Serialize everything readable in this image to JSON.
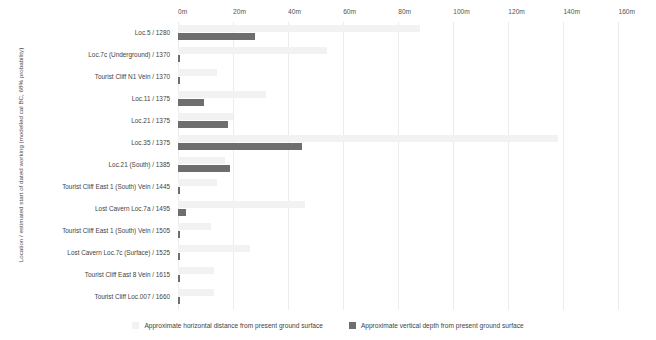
{
  "chart_data": {
    "type": "bar",
    "title": "",
    "subtitle": "",
    "orientation": "horizontal",
    "grouped": true,
    "xlabel": "",
    "ylabel": "Location / estimated start of dated working (modelled cal BC, 68% probability)",
    "xlim": [
      0,
      170
    ],
    "x_unit": "m",
    "grid": true,
    "grid_axis": "x",
    "legend_position": "bottom",
    "xticks": [
      0,
      20,
      40,
      60,
      80,
      100,
      120,
      140,
      160
    ],
    "xtick_labels": [
      "0m",
      "20m",
      "40m",
      "60m",
      "80m",
      "100m",
      "120m",
      "140m",
      "160m"
    ],
    "categories": [
      "Loc.5 / 1280",
      "Loc.7c (Underground) / 1370",
      "Tourist Cliff N1 Vein / 1370",
      "Loc.11 / 1375",
      "Loc.21 / 1375",
      "Loc.35 / 1375",
      "Loc.21 (South) / 1385",
      "Tourist Cliff East 1 (South) Vein / 1445",
      "Lost Cavern Loc.7a / 1495",
      "Tourist Cliff East 1 (South) Vein / 1505",
      "Lost Cavern Loc.7c (Surface) / 1525",
      "Tourist Cliff East 8 Vein / 1615",
      "Tourist Cliff Loc.007 / 1660"
    ],
    "series": [
      {
        "name": "Approximate horizontal distance from present ground surface",
        "color": "#f2f2f2",
        "values": [
          88,
          54,
          14,
          32,
          20,
          138,
          17,
          14,
          46,
          12,
          26,
          13,
          13
        ]
      },
      {
        "name": "Approximate vertical depth from present ground surface",
        "color": "#6e6e6e",
        "values": [
          28,
          0.6,
          0.6,
          9.5,
          18,
          45,
          19,
          0.6,
          3,
          0.6,
          0.6,
          0.8,
          0.6
        ]
      }
    ]
  },
  "legend": {
    "items": [
      {
        "label": "Approximate horizontal distance from present ground surface",
        "swatch_name": "legend-swatch-horizontal-distance",
        "color": "#f2f2f2"
      },
      {
        "label": "Approximate vertical depth from present ground surface",
        "swatch_name": "legend-swatch-vertical-depth",
        "color": "#6e6e6e"
      }
    ]
  },
  "axes": {
    "y_title": "Location / estimated start of dated working (modelled cal BC, 68% probability)"
  }
}
